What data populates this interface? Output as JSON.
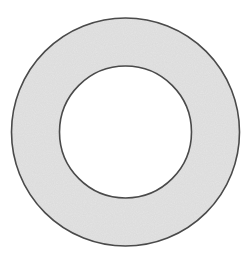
{
  "figure": {
    "type": "annulus",
    "canvas": {
      "width": 250,
      "height": 261
    },
    "center": {
      "x": 125.5,
      "y": 132
    },
    "outer_circle": {
      "r": 114,
      "stroke": "#4a4a4a",
      "stroke_width": 1.6
    },
    "inner_circle": {
      "r": 66,
      "stroke": "#4a4a4a",
      "stroke_width": 1.6
    },
    "colors": {
      "ring_fill": "#e4e4e4",
      "hole_fill": "#ffffff",
      "background": "#ffffff"
    }
  }
}
